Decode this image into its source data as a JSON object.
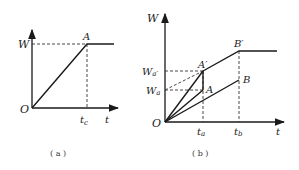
{
  "panels": [
    {
      "id": "a",
      "caption": "( a )",
      "y_axis_label": "W",
      "x_axis_label": "t",
      "origin_label": "O",
      "point_label": "A",
      "time_tick_label": "t",
      "time_tick_sub": "c"
    },
    {
      "id": "b",
      "caption": "( b )",
      "y_axis_label": "W",
      "x_axis_label": "t",
      "origin_label": "O",
      "points": {
        "A": "A",
        "A_prime": "A′",
        "B": "B",
        "B_prime": "B′"
      },
      "y_ticks": {
        "Wa_prime": {
          "main": "W",
          "sub": "a′"
        },
        "Wa": {
          "main": "W",
          "sub": "a"
        }
      },
      "x_ticks": {
        "ta": {
          "main": "t",
          "sub": "a"
        },
        "tb": {
          "main": "t",
          "sub": "b"
        }
      }
    }
  ],
  "colors": {
    "line": "#1a1a1a",
    "dashed": "#333333",
    "background": "#ffffff"
  }
}
